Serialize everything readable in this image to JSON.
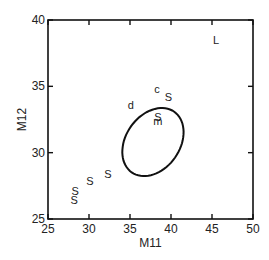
{
  "chart_data": {
    "type": "scatter",
    "title": "",
    "xlabel": "M11",
    "ylabel": "M12",
    "xlim": [
      25,
      50
    ],
    "ylim": [
      25,
      40
    ],
    "xticks": [
      25,
      30,
      35,
      40,
      45,
      50
    ],
    "yticks": [
      25,
      30,
      35,
      40
    ],
    "grid": false,
    "legend": null,
    "points": [
      {
        "label": "L",
        "x": 45.5,
        "y": 38.5
      },
      {
        "label": "c",
        "x": 38.3,
        "y": 34.8
      },
      {
        "label": "S",
        "x": 39.7,
        "y": 34.2
      },
      {
        "label": "d",
        "x": 35.1,
        "y": 33.6
      },
      {
        "label": "S",
        "x": 38.4,
        "y": 32.7
      },
      {
        "label": "m",
        "x": 38.4,
        "y": 32.4
      },
      {
        "label": "S",
        "x": 32.3,
        "y": 28.4
      },
      {
        "label": "S",
        "x": 30.1,
        "y": 27.9
      },
      {
        "label": "S",
        "x": 28.3,
        "y": 27.1
      },
      {
        "label": "S",
        "x": 28.2,
        "y": 26.4
      }
    ],
    "ellipse": {
      "cx": 37.8,
      "cy": 30.8,
      "x_extent": [
        33.0,
        42.7
      ],
      "y_extent": [
        27.8,
        33.8
      ],
      "tilt": "positive correlation"
    }
  },
  "colors": {
    "axis": "#111111",
    "text": "#222222",
    "ellipse": "#111111",
    "background": "#ffffff"
  }
}
